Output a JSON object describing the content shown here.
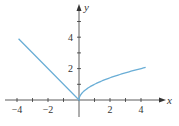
{
  "chart_data": {
    "type": "line",
    "title": "",
    "xlabel": "x",
    "ylabel": "y",
    "xlim": [
      -4.5,
      5
    ],
    "ylim": [
      -1,
      6
    ],
    "grid": false,
    "x_ticks": [
      -4,
      -3,
      -2,
      -1,
      1,
      2,
      3,
      4
    ],
    "x_tick_labels": [
      "-4",
      "-2",
      "2",
      "4"
    ],
    "x_tick_label_values": [
      -4,
      -2,
      2,
      4
    ],
    "y_ticks": [
      1,
      2,
      3,
      4,
      5
    ],
    "y_tick_labels": [
      "2",
      "4"
    ],
    "y_tick_label_values": [
      2,
      4
    ],
    "series": [
      {
        "name": "f(x) = -x for x<0, sqrt(x) for x>=0",
        "color": "#6aaed6",
        "x": [
          -3.9,
          -3,
          -2,
          -1,
          0,
          0.25,
          0.5,
          1,
          1.5,
          2,
          2.5,
          3,
          3.5,
          4,
          4.3
        ],
        "y": [
          3.9,
          3,
          2,
          1,
          0,
          0.5,
          0.707,
          1,
          1.225,
          1.414,
          1.581,
          1.732,
          1.871,
          2,
          2.074
        ]
      }
    ]
  },
  "colors": {
    "axis": "#333333",
    "curve": "#6aaed6"
  }
}
